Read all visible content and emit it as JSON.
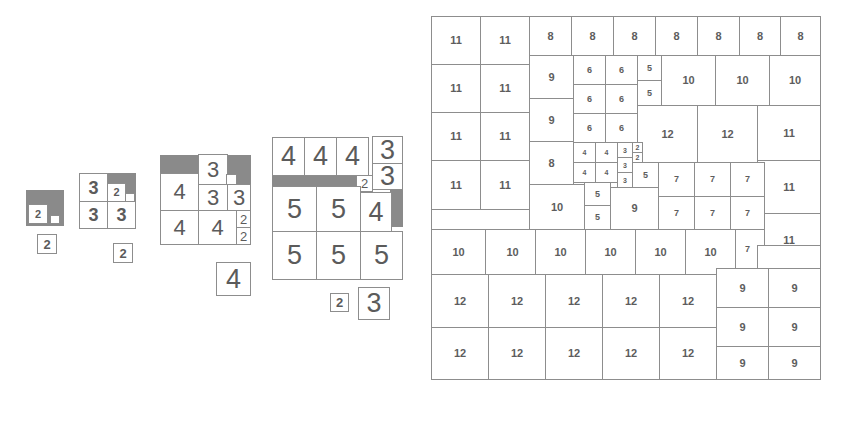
{
  "figure": {
    "colors": {
      "line": "#8d8d8d",
      "shade": "#8a8a8a",
      "text": "#5b5b5b",
      "background": "#ffffff"
    }
  },
  "panels": [
    {
      "id": "panel-1",
      "name": "order-2-dissection",
      "cells": [
        {
          "v": "2"
        },
        {
          "v": ""
        }
      ],
      "label": "2"
    },
    {
      "id": "panel-2",
      "name": "order-3-dissection",
      "cells": [
        {
          "v": "3"
        },
        {
          "v": "2"
        },
        {
          "v": ""
        },
        {
          "v": "3"
        },
        {
          "v": "3"
        }
      ],
      "label": "2"
    },
    {
      "id": "panel-3",
      "name": "order-4-dissection",
      "cells": [
        {
          "v": "3"
        },
        {
          "v": "4"
        },
        {
          "v": "3"
        },
        {
          "v": "3"
        },
        {
          "v": "4"
        },
        {
          "v": "4"
        },
        {
          "v": "2"
        },
        {
          "v": "2"
        }
      ],
      "label": "4"
    },
    {
      "id": "panel-4",
      "name": "order-5-dissection",
      "cells": [
        {
          "v": "4"
        },
        {
          "v": "4"
        },
        {
          "v": "4"
        },
        {
          "v": "3"
        },
        {
          "v": "3"
        },
        {
          "v": "2"
        },
        {
          "v": "5"
        },
        {
          "v": "5"
        },
        {
          "v": "4"
        },
        {
          "v": "5"
        },
        {
          "v": "5"
        },
        {
          "v": "5"
        }
      ],
      "labels": [
        "2",
        "3"
      ]
    }
  ],
  "grid": {
    "id": "panel-5",
    "name": "large-squared-square",
    "values": {
      "row_top_11a": "11",
      "row_top_11b": "11",
      "row_top_8a": "8",
      "row_top_8b": "8",
      "row_top_8c": "8",
      "row_top_8d": "8",
      "row_top_8e": "8",
      "row_top_8f": "8",
      "row_top_8g": "8",
      "l11_1": "11",
      "l11_2": "11",
      "l11_3": "11",
      "l11_4": "11",
      "l11_5": "11",
      "l11_6": "11",
      "l11_7": "11",
      "l11_8": "11",
      "c9a": "9",
      "c9b": "9",
      "c8": "8",
      "c10": "10",
      "s6_1": "6",
      "s6_2": "6",
      "s6_3": "6",
      "s6_4": "6",
      "s6_5": "6",
      "s6_6": "6",
      "s5a": "5",
      "s5b": "5",
      "t10a": "10",
      "t10b": "10",
      "t10c": "10",
      "m12a": "12",
      "m12b": "12",
      "r11a": "11",
      "r11b": "11",
      "r11c": "11",
      "r11d": "11",
      "q4_1": "4",
      "q4_2": "4",
      "q4_3": "4",
      "q4_4": "4",
      "q3_1": "3",
      "q3_2": "3",
      "q3_3": "3",
      "q2_1": "2",
      "q2_2": "2",
      "q5": "5",
      "v5a": "5",
      "v5b": "5",
      "c9big": "9",
      "s7_1": "7",
      "s7_2": "7",
      "s7_3": "7",
      "s7_4": "7",
      "s7_5": "7",
      "s7_6": "7",
      "s7_7": "7",
      "b10_1": "10",
      "b10_2": "10",
      "b10_3": "10",
      "b10_4": "10",
      "b10_5": "10",
      "b10_6": "10",
      "b12_1": "12",
      "b12_2": "12",
      "b12_3": "12",
      "b12_4": "12",
      "b12_5": "12",
      "b12_6": "12",
      "b12_7": "12",
      "b12_8": "12",
      "b12_9": "12",
      "b12_10": "12",
      "n9_1": "9",
      "n9_2": "9",
      "n9_3": "9",
      "n9_4": "9",
      "n9_5": "9",
      "n9_6": "9"
    }
  }
}
